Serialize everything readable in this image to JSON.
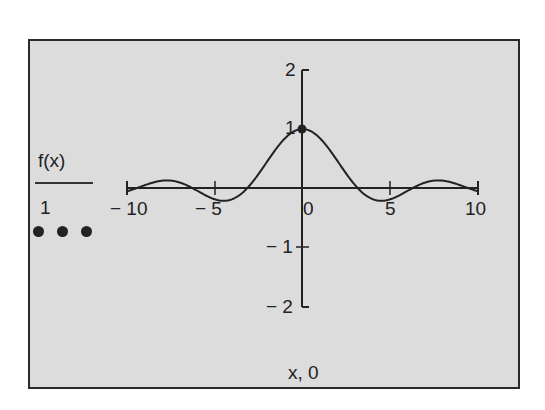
{
  "chart_data": {
    "type": "line",
    "title": "",
    "xlabel": "x, 0",
    "ylabel": "f(x)",
    "legend": {
      "expression": "f(x)",
      "weight": "1",
      "trace_style": "solid-line",
      "marker": "dots"
    },
    "xlim": [
      -10,
      10
    ],
    "ylim": [
      -2,
      2
    ],
    "x_ticks": [
      "− 10",
      "− 5",
      "0",
      "5",
      "10"
    ],
    "y_ticks": [
      "2",
      "1",
      "− 1",
      "− 2"
    ],
    "grid": false,
    "series": [
      {
        "name": "f(x)",
        "function": "sin(x)/x",
        "x": [
          -10,
          -9,
          -8,
          -7,
          -6,
          -5,
          -4,
          -3,
          -2,
          -1,
          0,
          1,
          2,
          3,
          4,
          5,
          6,
          7,
          8,
          9,
          10
        ],
        "values": [
          -0.054,
          0.046,
          0.124,
          0.094,
          -0.047,
          -0.192,
          -0.189,
          0.047,
          0.455,
          0.841,
          1.0,
          0.841,
          0.455,
          0.047,
          -0.189,
          -0.192,
          -0.047,
          0.094,
          0.124,
          0.046,
          -0.054
        ]
      }
    ],
    "markers": [
      {
        "x": 0,
        "y": 1
      }
    ],
    "colors": {
      "background": "#dcdcdc",
      "trace": "#222222",
      "frame": "#2a2a2a"
    }
  },
  "labels": {
    "legend_expression": "f(x)",
    "legend_weight": "1",
    "x_title": "x, 0",
    "x_tick_m10": "− 10",
    "x_tick_m5": "− 5",
    "x_tick_0": "0",
    "x_tick_5": "5",
    "x_tick_10": "10",
    "y_tick_2": "2",
    "y_tick_1": "1",
    "y_tick_m1": "− 1",
    "y_tick_m2": "− 2"
  }
}
